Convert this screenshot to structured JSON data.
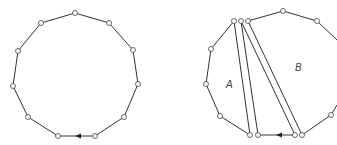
{
  "figure": {
    "left": {
      "vertices": [
        [
          75,
          13
        ],
        [
          109,
          23
        ],
        [
          133,
          50
        ],
        [
          138,
          84
        ],
        [
          124,
          117
        ],
        [
          95,
          136
        ],
        [
          58,
          136
        ],
        [
          28,
          117
        ],
        [
          13,
          86
        ],
        [
          18,
          51
        ],
        [
          41,
          23
        ]
      ],
      "arrow": {
        "x": 79,
        "y": 136,
        "direction": "left"
      }
    },
    "right": {
      "labels": {
        "a": "A",
        "b": "B"
      },
      "label_positions": {
        "a": [
          227,
          87
        ],
        "b": [
          296,
          71
        ]
      }
    },
    "colors": {
      "stroke": "#333333",
      "vertex_fill": "#ffffff"
    }
  }
}
